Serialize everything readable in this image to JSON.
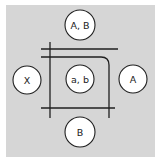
{
  "diagram": {
    "background": "#d6d6d6",
    "line_color": "#1f1f1f",
    "circle_fill": "#ffffff",
    "nodes": [
      {
        "id": "top",
        "label": "A, B",
        "cx": 80,
        "cy": 25,
        "r": 15
      },
      {
        "id": "left",
        "label": "X",
        "cx": 27,
        "cy": 80,
        "r": 14
      },
      {
        "id": "center",
        "label": "a, b",
        "cx": 80,
        "cy": 79,
        "r": 14
      },
      {
        "id": "right",
        "label": "A",
        "cx": 133,
        "cy": 79,
        "r": 14
      },
      {
        "id": "bottom",
        "label": "B",
        "cx": 80,
        "cy": 132,
        "r": 15
      }
    ],
    "lines": [
      {
        "id": "top-horizontal",
        "x1": 41,
        "y1": 49,
        "x2": 118,
        "y2": 49
      },
      {
        "id": "left-vertical",
        "x1": 50,
        "y1": 42,
        "x2": 50,
        "y2": 118
      },
      {
        "id": "bottom-horizontal",
        "x1": 41,
        "y1": 108,
        "x2": 115,
        "y2": 108
      },
      {
        "id": "right-curved",
        "path": "M41 57 H101 Q109 57 109 65 V118"
      }
    ]
  }
}
